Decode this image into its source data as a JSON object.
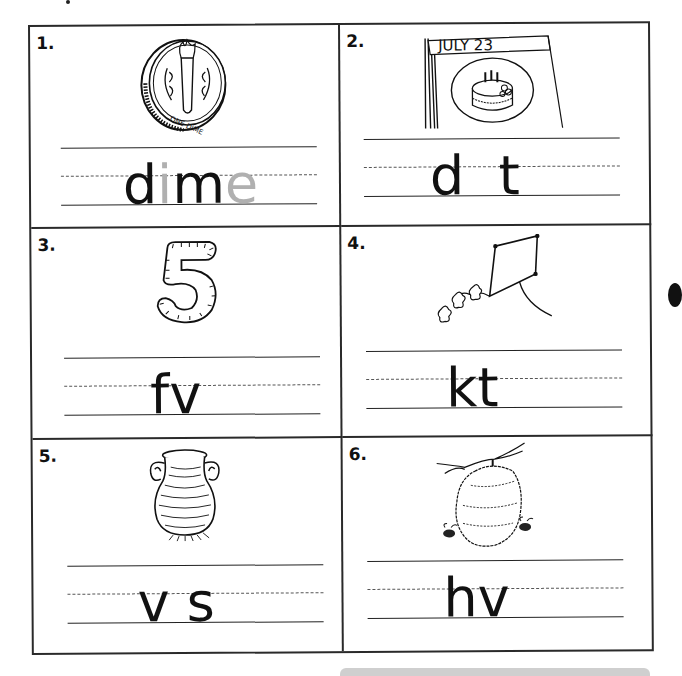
{
  "worksheet": {
    "items": [
      {
        "number": "1.",
        "picture": "dime-coin",
        "picture_text": "ONE DIME",
        "word_parts": [
          {
            "text": "d",
            "style": "ink"
          },
          {
            "text": "i",
            "style": "ghost"
          },
          {
            "text": "m",
            "style": "ink"
          },
          {
            "text": "e",
            "style": "ghost"
          }
        ]
      },
      {
        "number": "2.",
        "picture": "birthday-calendar-cake",
        "picture_text": "JULY   23",
        "word_parts": [
          {
            "text": "d",
            "style": "ink"
          },
          {
            "text": "  ",
            "style": "ink"
          },
          {
            "text": "t",
            "style": "ink"
          }
        ]
      },
      {
        "number": "3.",
        "picture": "number-five",
        "picture_text": "5",
        "word_parts": [
          {
            "text": "f",
            "style": "ink"
          },
          {
            "text": "v",
            "style": "ink"
          }
        ]
      },
      {
        "number": "4.",
        "picture": "kite",
        "picture_text": "",
        "word_parts": [
          {
            "text": "k",
            "style": "ink"
          },
          {
            "text": "t",
            "style": "ink"
          }
        ]
      },
      {
        "number": "5.",
        "picture": "vase",
        "picture_text": "",
        "word_parts": [
          {
            "text": "v",
            "style": "ink"
          },
          {
            "text": " ",
            "style": "ink"
          },
          {
            "text": "s",
            "style": "ink"
          }
        ]
      },
      {
        "number": "6.",
        "picture": "beehive",
        "picture_text": "",
        "word_parts": [
          {
            "text": "h",
            "style": "ink"
          },
          {
            "text": "v",
            "style": "ink"
          }
        ]
      }
    ]
  },
  "colors": {
    "ink": "#111111",
    "ghost_letter": "#b0b0b0",
    "border": "#2a2a2a"
  }
}
